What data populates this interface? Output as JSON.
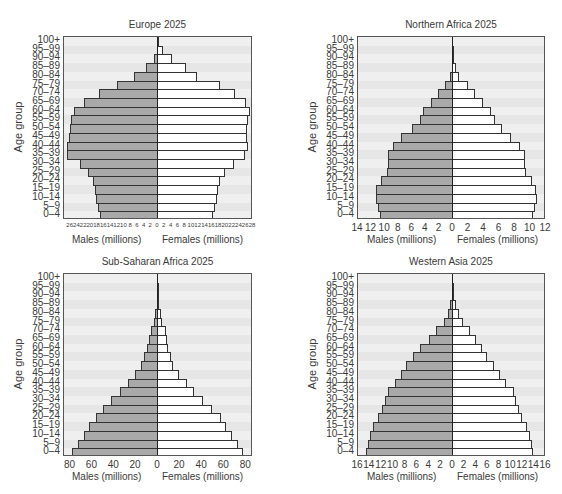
{
  "age_groups": [
    "0-4",
    "5-9",
    "10-14",
    "15-19",
    "20-24",
    "25-29",
    "30-34",
    "35-39",
    "40-44",
    "45-49",
    "50-54",
    "55-59",
    "60-64",
    "65-69",
    "70-74",
    "75-79",
    "80-84",
    "85-89",
    "90-94",
    "95-99",
    "100+"
  ],
  "age_labels_top_down": [
    "100+",
    "95–99",
    "90–94",
    "85–89",
    "80–84",
    "75–79",
    "70–74",
    "65–69",
    "60–64",
    "55–59",
    "50–54",
    "45–49",
    "40–44",
    "35–39",
    "30–34",
    "25–29",
    "20–24",
    "15–19",
    "10–14",
    "5–9",
    "0–4"
  ],
  "colors": {
    "male": "#a9a9a9",
    "female": "#ffffff",
    "background": "#efefef",
    "stripe": "#e6e6e6",
    "outline": "#333333"
  },
  "chart_data": [
    {
      "type": "bar",
      "orientation": "horizontal-population-pyramid",
      "title": "Europe 2025",
      "ylabel": "Age group",
      "xlabel_left": "Males (millions)",
      "xlabel_right": "Females (millions)",
      "xlim": [
        0,
        28
      ],
      "xticks_left": [
        "26",
        "24",
        "22",
        "20",
        "18",
        "16",
        "14",
        "12",
        "10",
        "8",
        "6",
        "4",
        "2"
      ],
      "xticks_right": [
        "0",
        "2",
        "4",
        "6",
        "8",
        "10",
        "12",
        "14",
        "16",
        "18",
        "20",
        "22",
        "24",
        "26",
        "28"
      ],
      "categories": [
        "0-4",
        "5-9",
        "10-14",
        "15-19",
        "20-24",
        "25-29",
        "30-34",
        "35-39",
        "40-44",
        "45-49",
        "50-54",
        "55-59",
        "60-64",
        "65-69",
        "70-74",
        "75-79",
        "80-84",
        "85-89",
        "90-94",
        "95-99",
        "100+"
      ],
      "series": [
        {
          "name": "Males",
          "values": [
            17.2,
            17.8,
            18.4,
            18.9,
            19.5,
            20.8,
            23.3,
            27.0,
            27.1,
            26.6,
            26.2,
            25.8,
            25.0,
            22.0,
            17.5,
            12.3,
            7.2,
            3.7,
            1.3,
            0.4,
            0.1
          ]
        },
        {
          "name": "Females",
          "values": [
            16.2,
            16.8,
            17.3,
            17.8,
            18.4,
            19.6,
            22.4,
            25.6,
            26.6,
            26.2,
            26.1,
            26.5,
            27.2,
            25.9,
            22.6,
            18.3,
            11.6,
            8.2,
            4.2,
            1.5,
            0.3
          ]
        }
      ]
    },
    {
      "type": "bar",
      "orientation": "horizontal-population-pyramid",
      "title": "Northern Africa 2025",
      "ylabel": "Age group",
      "xlabel_left": "Males (millions)",
      "xlabel_right": "Females (millions)",
      "xlim_left": [
        0,
        14
      ],
      "xlim_right": [
        0,
        12
      ],
      "xticks_left": [
        "14",
        "12",
        "10",
        "8",
        "6",
        "4",
        "2"
      ],
      "xticks_right": [
        "0",
        "2",
        "4",
        "6",
        "8",
        "10",
        "12"
      ],
      "categories": [
        "0-4",
        "5-9",
        "10-14",
        "15-19",
        "20-24",
        "25-29",
        "30-34",
        "35-39",
        "40-44",
        "45-49",
        "50-54",
        "55-59",
        "60-64",
        "65-69",
        "70-74",
        "75-79",
        "80-84",
        "85-89",
        "90-94",
        "95-99",
        "100+"
      ],
      "series": [
        {
          "name": "Males",
          "values": [
            10.8,
            11.1,
            11.3,
            11.3,
            10.6,
            9.8,
            9.6,
            9.6,
            8.9,
            7.6,
            6.1,
            4.9,
            4.4,
            3.2,
            2.2,
            1.2,
            0.5,
            0.2,
            0.05,
            0.02,
            0.0
          ]
        },
        {
          "name": "Females",
          "values": [
            10.3,
            10.6,
            10.8,
            10.7,
            10.2,
            9.4,
            9.3,
            9.3,
            8.6,
            7.5,
            6.3,
            5.4,
            4.9,
            3.9,
            2.9,
            1.9,
            0.8,
            0.4,
            0.1,
            0.03,
            0.0
          ]
        }
      ]
    },
    {
      "type": "bar",
      "orientation": "horizontal-population-pyramid",
      "title": "Sub-Saharan Africa 2025",
      "ylabel": "Age group",
      "xlabel_left": "Males (millions)",
      "xlabel_right": "Females (millions)",
      "xlim": [
        0,
        80
      ],
      "xticks_left": [
        "80",
        "60",
        "40",
        "20"
      ],
      "xticks_right": [
        "0",
        "20",
        "40",
        "60",
        "80"
      ],
      "categories": [
        "0-4",
        "5-9",
        "10-14",
        "15-19",
        "20-24",
        "25-29",
        "30-34",
        "35-39",
        "40-44",
        "45-49",
        "50-54",
        "55-59",
        "60-64",
        "65-69",
        "70-74",
        "75-79",
        "80-84",
        "85-89",
        "90-94",
        "95-99",
        "100+"
      ],
      "series": [
        {
          "name": "Males",
          "values": [
            79,
            73,
            68,
            63,
            57,
            50,
            43,
            35,
            27,
            21,
            16,
            13,
            10,
            8,
            6,
            4,
            2.5,
            1.2,
            0.5,
            0.1,
            0.0
          ]
        },
        {
          "name": "Females",
          "values": [
            77,
            72,
            67,
            62,
            57,
            49,
            41,
            33,
            26,
            19,
            14,
            12,
            9,
            8,
            7,
            4,
            2.5,
            1.3,
            0.5,
            0.1,
            0.0
          ]
        }
      ]
    },
    {
      "type": "bar",
      "orientation": "horizontal-population-pyramid",
      "title": "Western Asia 2025",
      "ylabel": "Age group",
      "xlabel_left": "Males (millions)",
      "xlabel_right": "Females (millions)",
      "xlim": [
        0,
        16
      ],
      "xticks_left": [
        "16",
        "14",
        "12",
        "10",
        "8",
        "6",
        "4",
        "2"
      ],
      "xticks_right": [
        "0",
        "2",
        "4",
        "6",
        "8",
        "10",
        "12",
        "14",
        "16"
      ],
      "categories": [
        "0-4",
        "5-9",
        "10-14",
        "15-19",
        "20-24",
        "25-29",
        "30-34",
        "35-39",
        "40-44",
        "45-49",
        "50-54",
        "55-59",
        "60-64",
        "65-69",
        "70-74",
        "75-79",
        "80-84",
        "85-89",
        "90-94",
        "95-99",
        "100+"
      ],
      "series": [
        {
          "name": "Males",
          "values": [
            14.7,
            14.3,
            13.9,
            13.4,
            12.6,
            12.0,
            11.5,
            11.0,
            9.8,
            8.7,
            7.9,
            6.7,
            5.6,
            4.0,
            2.8,
            1.6,
            0.8,
            0.5,
            0.2,
            0.05,
            0.0
          ]
        },
        {
          "name": "Females",
          "values": [
            13.8,
            13.6,
            13.3,
            12.7,
            11.9,
            11.3,
            10.9,
            10.5,
            9.1,
            8.0,
            7.0,
            5.9,
            5.0,
            4.0,
            3.0,
            1.8,
            1.0,
            0.5,
            0.2,
            0.05,
            0.0
          ]
        }
      ]
    }
  ]
}
